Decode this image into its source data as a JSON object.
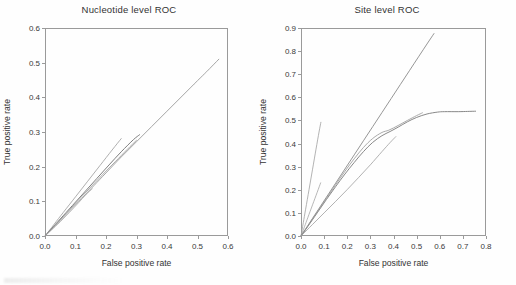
{
  "figure": {
    "width": 516,
    "height": 285,
    "background": "#ffffff",
    "axis_color": "#9a9a9a",
    "text_color": "#333333"
  },
  "chart_data": [
    {
      "type": "line",
      "panel": "left",
      "title": "Nucleotide level ROC",
      "xlabel": "False positive rate",
      "ylabel": "True positive rate",
      "xlim": [
        0.0,
        0.6
      ],
      "ylim": [
        0.0,
        0.6
      ],
      "xticks": [
        "0.0",
        "0.1",
        "0.2",
        "0.3",
        "0.4",
        "0.5",
        "0.6"
      ],
      "ytickvals": [
        0.0,
        0.1,
        0.2,
        0.3,
        0.4,
        0.5,
        0.6
      ],
      "yticks": [
        "0.0",
        "0.1",
        "0.2",
        "0.3",
        "0.4",
        "0.5",
        "0.6"
      ],
      "xtickvals": [
        0.0,
        0.1,
        0.2,
        0.3,
        0.4,
        0.5,
        0.6
      ],
      "grid": false,
      "legend": "none",
      "series": [
        {
          "name": "curve-1-long",
          "color": "#8d8d8d",
          "width": 0.8,
          "points": [
            [
              0.0,
              0.0
            ],
            [
              0.02,
              0.018
            ],
            [
              0.05,
              0.045
            ],
            [
              0.08,
              0.072
            ],
            [
              0.12,
              0.108
            ],
            [
              0.16,
              0.145
            ],
            [
              0.2,
              0.182
            ],
            [
              0.25,
              0.228
            ],
            [
              0.3,
              0.272
            ],
            [
              0.35,
              0.316
            ],
            [
              0.4,
              0.36
            ],
            [
              0.45,
              0.404
            ],
            [
              0.5,
              0.448
            ],
            [
              0.53,
              0.474
            ],
            [
              0.57,
              0.51
            ]
          ]
        },
        {
          "name": "curve-2-steep-short",
          "color": "#9b9b9b",
          "width": 0.8,
          "points": [
            [
              0.0,
              0.0
            ],
            [
              0.03,
              0.034
            ],
            [
              0.06,
              0.068
            ],
            [
              0.1,
              0.113
            ],
            [
              0.14,
              0.158
            ],
            [
              0.18,
              0.203
            ],
            [
              0.22,
              0.248
            ],
            [
              0.25,
              0.281
            ]
          ]
        },
        {
          "name": "curve-3-dark-diagonal",
          "color": "#6f6f6f",
          "width": 0.9,
          "points": [
            [
              0.0,
              0.0
            ],
            [
              0.02,
              0.02
            ],
            [
              0.05,
              0.049
            ],
            [
              0.09,
              0.088
            ],
            [
              0.13,
              0.127
            ],
            [
              0.17,
              0.166
            ],
            [
              0.21,
              0.205
            ],
            [
              0.25,
              0.243
            ],
            [
              0.29,
              0.278
            ],
            [
              0.31,
              0.292
            ]
          ]
        },
        {
          "name": "curve-4-low-short",
          "color": "#a8a8a8",
          "width": 0.8,
          "points": [
            [
              0.0,
              0.0
            ],
            [
              0.02,
              0.016
            ],
            [
              0.05,
              0.041
            ],
            [
              0.08,
              0.068
            ],
            [
              0.11,
              0.096
            ],
            [
              0.135,
              0.12
            ],
            [
              0.155,
              0.136
            ]
          ]
        },
        {
          "name": "curve-5-mid",
          "color": "#949494",
          "width": 0.8,
          "points": [
            [
              0.0,
              0.0
            ],
            [
              0.03,
              0.028
            ],
            [
              0.07,
              0.066
            ],
            [
              0.11,
              0.104
            ],
            [
              0.15,
              0.141
            ],
            [
              0.19,
              0.178
            ],
            [
              0.23,
              0.214
            ],
            [
              0.27,
              0.25
            ],
            [
              0.3,
              0.276
            ]
          ]
        }
      ]
    },
    {
      "type": "line",
      "panel": "right",
      "title": "Site level ROC",
      "xlabel": "False positive rate",
      "ylabel": "True positive rate",
      "xlim": [
        0.0,
        0.8
      ],
      "ylim": [
        0.0,
        0.9
      ],
      "xticks": [
        "0.0",
        "0.1",
        "0.2",
        "0.3",
        "0.4",
        "0.5",
        "0.6",
        "0.7",
        "0.8"
      ],
      "xtickvals": [
        0.0,
        0.1,
        0.2,
        0.3,
        0.4,
        0.5,
        0.6,
        0.7,
        0.8
      ],
      "yticks": [
        "0.0",
        "0.1",
        "0.2",
        "0.3",
        "0.4",
        "0.5",
        "0.6",
        "0.7",
        "0.8",
        "0.9"
      ],
      "ytickvals": [
        0.0,
        0.1,
        0.2,
        0.3,
        0.4,
        0.5,
        0.6,
        0.7,
        0.8,
        0.9
      ],
      "grid": false,
      "legend": "none",
      "series": [
        {
          "name": "curve-1-very-steep",
          "color": "#a0a0a0",
          "width": 0.8,
          "points": [
            [
              0.0,
              0.0
            ],
            [
              0.01,
              0.058
            ],
            [
              0.02,
              0.116
            ],
            [
              0.035,
              0.202
            ],
            [
              0.05,
              0.289
            ],
            [
              0.065,
              0.376
            ],
            [
              0.078,
              0.45
            ],
            [
              0.086,
              0.492
            ]
          ]
        },
        {
          "name": "curve-2-steep-short",
          "color": "#a4a4a4",
          "width": 0.8,
          "points": [
            [
              0.0,
              0.0
            ],
            [
              0.015,
              0.04
            ],
            [
              0.03,
              0.081
            ],
            [
              0.05,
              0.135
            ],
            [
              0.07,
              0.189
            ],
            [
              0.085,
              0.23
            ]
          ]
        },
        {
          "name": "curve-3-long-rising",
          "color": "#8a8a8a",
          "width": 0.9,
          "points": [
            [
              0.0,
              0.0
            ],
            [
              0.03,
              0.046
            ],
            [
              0.07,
              0.107
            ],
            [
              0.11,
              0.168
            ],
            [
              0.15,
              0.229
            ],
            [
              0.19,
              0.29
            ],
            [
              0.23,
              0.351
            ],
            [
              0.27,
              0.412
            ],
            [
              0.31,
              0.473
            ],
            [
              0.35,
              0.534
            ],
            [
              0.39,
              0.595
            ],
            [
              0.43,
              0.656
            ],
            [
              0.47,
              0.717
            ],
            [
              0.51,
              0.778
            ],
            [
              0.545,
              0.831
            ],
            [
              0.575,
              0.876
            ]
          ]
        },
        {
          "name": "curve-4-plateau",
          "color": "#7a7a7a",
          "width": 0.9,
          "points": [
            [
              0.0,
              0.0
            ],
            [
              0.03,
              0.042
            ],
            [
              0.07,
              0.1
            ],
            [
              0.11,
              0.158
            ],
            [
              0.15,
              0.214
            ],
            [
              0.19,
              0.268
            ],
            [
              0.23,
              0.318
            ],
            [
              0.27,
              0.365
            ],
            [
              0.31,
              0.405
            ],
            [
              0.35,
              0.434
            ],
            [
              0.385,
              0.452
            ],
            [
              0.42,
              0.471
            ],
            [
              0.46,
              0.494
            ],
            [
              0.5,
              0.513
            ],
            [
              0.545,
              0.528
            ],
            [
              0.59,
              0.536
            ],
            [
              0.62,
              0.538
            ],
            [
              0.68,
              0.538
            ],
            [
              0.72,
              0.539
            ],
            [
              0.755,
              0.54
            ]
          ]
        },
        {
          "name": "curve-5-straightish",
          "color": "#949494",
          "width": 0.8,
          "points": [
            [
              0.0,
              0.0
            ],
            [
              0.03,
              0.044
            ],
            [
              0.07,
              0.104
            ],
            [
              0.11,
              0.163
            ],
            [
              0.15,
              0.222
            ],
            [
              0.19,
              0.28
            ],
            [
              0.23,
              0.334
            ],
            [
              0.27,
              0.383
            ],
            [
              0.31,
              0.422
            ],
            [
              0.35,
              0.448
            ],
            [
              0.38,
              0.458
            ],
            [
              0.42,
              0.478
            ],
            [
              0.46,
              0.5
            ],
            [
              0.5,
              0.521
            ],
            [
              0.525,
              0.533
            ]
          ]
        },
        {
          "name": "curve-6-shallow",
          "color": "#9e9e9e",
          "width": 0.8,
          "points": [
            [
              0.0,
              0.0
            ],
            [
              0.05,
              0.05
            ],
            [
              0.1,
              0.1
            ],
            [
              0.15,
              0.15
            ],
            [
              0.2,
              0.201
            ],
            [
              0.25,
              0.254
            ],
            [
              0.3,
              0.308
            ],
            [
              0.35,
              0.365
            ],
            [
              0.385,
              0.404
            ],
            [
              0.41,
              0.43
            ]
          ]
        }
      ]
    }
  ]
}
